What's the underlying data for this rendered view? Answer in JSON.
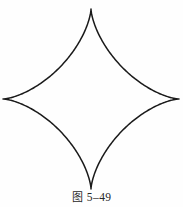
{
  "figure": {
    "caption_label": "图",
    "caption_number": "5–49",
    "caption_full": "图 5–49",
    "shape_name": "astroid",
    "stroke_color": "#1a1a1a",
    "background_color": "#fefefe",
    "fill": "none"
  },
  "chart_data": {
    "type": "line",
    "xlabel": "",
    "ylabel": "",
    "curve": "astroid",
    "equation": "x^(2/3) + y^(2/3) = a^(2/3)",
    "center": [
      91,
      99
    ],
    "radius_x": 88,
    "radius_y": 90,
    "cusps": [
      {
        "name": "top",
        "x": 91,
        "y": 9
      },
      {
        "name": "right",
        "x": 179,
        "y": 99
      },
      {
        "name": "bottom",
        "x": 91,
        "y": 189
      },
      {
        "name": "left",
        "x": 3,
        "y": 99
      }
    ],
    "grid": false,
    "legend": "none",
    "axes_visible": false
  }
}
